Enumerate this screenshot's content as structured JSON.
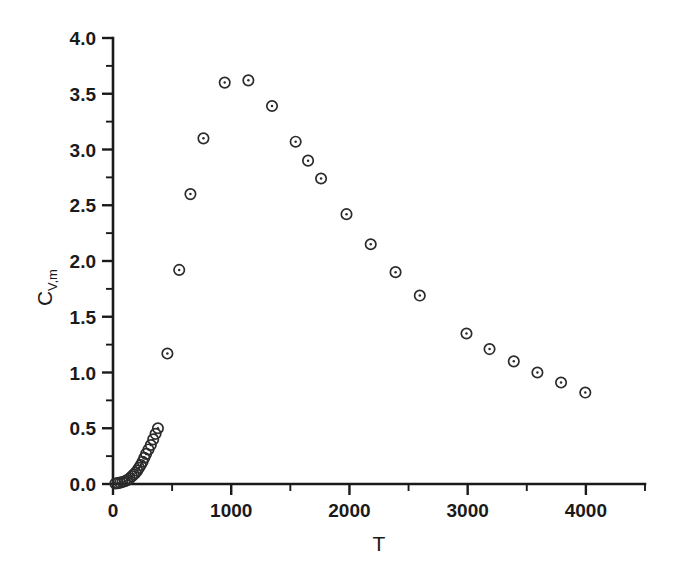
{
  "chart_data": {
    "type": "scatter",
    "title": "",
    "subtitle": "",
    "xlabel": "T",
    "ylabel": "C",
    "ylabel_subscript": "V,m",
    "xlim": [
      0,
      4500
    ],
    "ylim": [
      0.0,
      4.0
    ],
    "x_major_ticks": [
      0,
      1000,
      2000,
      3000,
      4000
    ],
    "x_major_tick_labels": [
      "0",
      "1000",
      "2000",
      "3000",
      "4000"
    ],
    "x_minor_tick_step": 500,
    "y_major_ticks": [
      0.0,
      0.5,
      1.0,
      1.5,
      2.0,
      2.5,
      3.0,
      3.5,
      4.0
    ],
    "y_major_tick_labels": [
      "0.0",
      "0.5",
      "1.0",
      "1.5",
      "2.0",
      "2.5",
      "3.0",
      "3.5",
      "4.0"
    ],
    "y_minor_tick_step": 0.25,
    "grid": false,
    "legend": null,
    "marker_style": "open-circle-with-center-dot",
    "marker_color": "#2b2b2b",
    "series": [
      {
        "name": "Cv,m vs T",
        "x": [
          20,
          40,
          60,
          80,
          100,
          120,
          140,
          160,
          175,
          190,
          205,
          220,
          235,
          250,
          265,
          280,
          300,
          320,
          340,
          360,
          380,
          460,
          560,
          655,
          765,
          945,
          1145,
          1345,
          1545,
          1650,
          1760,
          1975,
          2180,
          2390,
          2595,
          2990,
          3185,
          3390,
          3590,
          3790,
          3995
        ],
        "y": [
          0.005,
          0.008,
          0.012,
          0.018,
          0.025,
          0.035,
          0.05,
          0.07,
          0.085,
          0.1,
          0.12,
          0.145,
          0.17,
          0.2,
          0.235,
          0.27,
          0.31,
          0.35,
          0.4,
          0.45,
          0.5,
          1.17,
          1.92,
          2.6,
          3.1,
          3.6,
          3.62,
          3.39,
          3.07,
          2.9,
          2.74,
          2.42,
          2.15,
          1.9,
          1.69,
          1.35,
          1.21,
          1.1,
          1.0,
          0.91,
          0.82
        ]
      }
    ]
  },
  "axes": {
    "x_axis_name": "x-axis",
    "y_axis_name": "y-axis"
  }
}
